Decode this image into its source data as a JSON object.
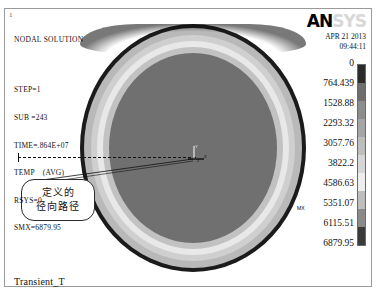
{
  "window": {
    "corner_number": "1",
    "bottom_title": "Transient_T"
  },
  "info": {
    "title": "NODAL SOLUTION",
    "lines": [
      "STEP=1",
      "SUB =243",
      "TIME=.864E+07",
      "TEMP    (AVG)",
      "RSYS=0",
      "SMX=6879.95"
    ]
  },
  "branding": {
    "logo_primary": "AN",
    "logo_secondary": "SYS",
    "date": "APR 21 2013",
    "time": "09:44:11"
  },
  "annotation": {
    "line1": "定义的",
    "line2": "径向路径",
    "max_marker": "MX"
  },
  "triad": {
    "axis_x": "X",
    "axis_y": "Y",
    "axis_z": "Z"
  },
  "chart_data": {
    "type": "heatmap",
    "title": "Transient_T",
    "variable": "TEMP",
    "units_label": "",
    "legend_position": "right",
    "grid": false,
    "geometry": "circular cross-section contour (radial temperature field)",
    "smx": 6879.95,
    "contour_levels": [
      0,
      764.439,
      1528.88,
      2293.32,
      3057.76,
      3822.2,
      4586.63,
      5351.07,
      6115.51,
      6879.95
    ],
    "band_colors": [
      "#2b2b2b",
      "#6e6e6e",
      "#8d8d8d",
      "#a5a5a5",
      "#bdbdbd",
      "#d6d6d6",
      "#ededed",
      "#bdbdbd",
      "#8a8a8a",
      "#3a3a3a"
    ],
    "rings_outside_in": [
      {
        "label": "outer rim",
        "color": "#1b1b1b",
        "value_band": "0 - 764.439"
      },
      {
        "label": "ring 1",
        "color": "#b9b9b9",
        "value_band": "764.439 - 2293.32"
      },
      {
        "label": "ring 2",
        "color": "#cfcfcf",
        "value_band": "2293.32 - 3822.2"
      },
      {
        "label": "ring 3",
        "color": "#e8e8e8",
        "value_band": "3822.2 - 4586.63"
      },
      {
        "label": "ring 4",
        "color": "#c2c2c2",
        "value_band": "4586.63 - 5351.07"
      },
      {
        "label": "core",
        "color": "#707070",
        "value_band": "5351.07 - 6879.95"
      }
    ],
    "legend_entries": [
      {
        "value": "0",
        "top": 0
      },
      {
        "value": "764.439",
        "top": 20
      },
      {
        "value": "1528.88",
        "top": 40
      },
      {
        "value": "2293.32",
        "top": 60
      },
      {
        "value": "3057.76",
        "top": 80
      },
      {
        "value": "3822.2",
        "top": 100
      },
      {
        "value": "4586.63",
        "top": 120
      },
      {
        "value": "5351.07",
        "top": 140
      },
      {
        "value": "6115.51",
        "top": 160
      },
      {
        "value": "6879.95",
        "top": 180
      }
    ]
  }
}
